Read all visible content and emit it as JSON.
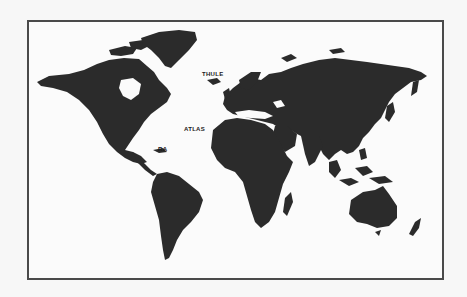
{
  "map": {
    "type": "world-map",
    "style": "black land on white, bordered frame",
    "colors": {
      "land": "#2b2b2b",
      "water": "#fbfbfb",
      "border": "#4a4a4a",
      "page": "#f7f7f7"
    },
    "labels": [
      {
        "id": "thule",
        "text": "THULE",
        "x": 202,
        "y": 71
      },
      {
        "id": "atlas",
        "text": "ATLAS",
        "x": 184,
        "y": 126
      },
      {
        "id": "ra",
        "text": "RA",
        "x": 158,
        "y": 146
      }
    ]
  }
}
